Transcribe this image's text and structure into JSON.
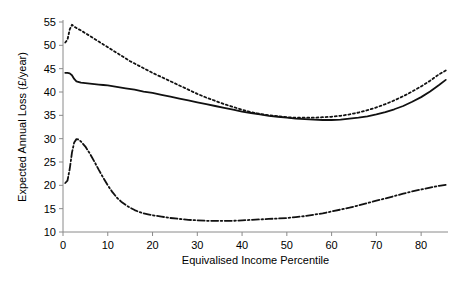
{
  "chart_data": {
    "type": "line",
    "title": "",
    "subtitle": "",
    "xlabel": "Equivalised Income Percentile",
    "ylabel": "Expected Annual Loss (£/year)",
    "xlim": [
      0,
      86
    ],
    "ylim": [
      10,
      55
    ],
    "xticks": [
      0,
      10,
      20,
      30,
      40,
      50,
      60,
      70,
      80
    ],
    "yticks": [
      10,
      15,
      20,
      25,
      30,
      35,
      40,
      45,
      50,
      55
    ],
    "xtick_labels": [
      "0",
      "10",
      "20",
      "30",
      "40",
      "50",
      "60",
      "70",
      "80"
    ],
    "ytick_labels": [
      "10",
      "15",
      "20",
      "25",
      "30",
      "35",
      "40",
      "45",
      "50",
      "55"
    ],
    "grid": false,
    "legend_position": "bottom",
    "line_color": "#111111",
    "axis_color": "#8a8a8a",
    "series": [
      {
        "name": "Black",
        "style": "dotted",
        "dasharray": "2,2.6",
        "width": 1.8,
        "x": [
          0.5,
          1,
          1.5,
          2,
          2.5,
          3,
          4,
          5,
          6,
          7,
          8,
          9,
          10,
          11,
          12,
          13,
          14,
          15,
          16,
          17,
          18,
          19,
          20,
          22,
          24,
          26,
          28,
          30,
          32,
          34,
          36,
          38,
          40,
          42,
          44,
          46,
          48,
          50,
          52,
          54,
          56,
          58,
          60,
          62,
          64,
          66,
          68,
          70,
          72,
          74,
          76,
          78,
          80,
          82,
          84,
          85.5
        ],
        "y": [
          50.6,
          51.2,
          53.4,
          54.4,
          54.0,
          53.7,
          53.2,
          52.6,
          52.0,
          51.4,
          50.8,
          50.2,
          49.6,
          49.0,
          48.4,
          47.8,
          47.2,
          46.6,
          46.1,
          45.6,
          45.1,
          44.6,
          44.1,
          43.2,
          42.3,
          41.4,
          40.5,
          39.6,
          38.8,
          38.1,
          37.4,
          36.8,
          36.2,
          35.7,
          35.3,
          35.0,
          34.8,
          34.6,
          34.5,
          34.5,
          34.5,
          34.6,
          34.7,
          34.9,
          35.2,
          35.6,
          36.1,
          36.7,
          37.4,
          38.2,
          39.1,
          40.1,
          41.2,
          42.4,
          43.8,
          44.6
        ]
      },
      {
        "name": "Asian",
        "style": "solid",
        "dasharray": "",
        "width": 1.8,
        "x": [
          0.5,
          1,
          1.5,
          2,
          2.5,
          3,
          4,
          5,
          6,
          7,
          8,
          9,
          10,
          12,
          14,
          16,
          18,
          20,
          22,
          24,
          26,
          28,
          30,
          32,
          34,
          36,
          38,
          40,
          42,
          44,
          46,
          48,
          50,
          52,
          54,
          56,
          58,
          60,
          62,
          64,
          66,
          68,
          70,
          72,
          74,
          76,
          78,
          80,
          82,
          84,
          85.5
        ],
        "y": [
          44.1,
          44.1,
          44.0,
          43.6,
          42.8,
          42.3,
          42.0,
          41.9,
          41.8,
          41.7,
          41.6,
          41.5,
          41.4,
          41.1,
          40.8,
          40.5,
          40.1,
          39.8,
          39.4,
          39.0,
          38.6,
          38.2,
          37.8,
          37.4,
          37.0,
          36.6,
          36.2,
          35.8,
          35.5,
          35.2,
          34.9,
          34.7,
          34.5,
          34.3,
          34.2,
          34.1,
          34.0,
          34.0,
          34.1,
          34.3,
          34.5,
          34.8,
          35.2,
          35.7,
          36.3,
          37.0,
          37.9,
          38.9,
          40.1,
          41.5,
          42.6
        ]
      },
      {
        "name": "White & other",
        "style": "dash-dot",
        "dasharray": "7,2.5,1.6,2.5",
        "width": 1.8,
        "x": [
          0.5,
          1,
          1.5,
          2,
          2.5,
          3,
          3.5,
          4,
          5,
          6,
          7,
          8,
          9,
          10,
          11,
          12,
          13,
          14,
          15,
          16,
          17,
          18,
          19,
          20,
          22,
          24,
          26,
          28,
          30,
          32,
          34,
          36,
          38,
          40,
          42,
          44,
          46,
          48,
          50,
          52,
          54,
          56,
          58,
          60,
          62,
          64,
          66,
          68,
          70,
          72,
          74,
          76,
          78,
          80,
          82,
          84,
          85.5
        ],
        "y": [
          20.5,
          21.0,
          23.5,
          27.0,
          29.2,
          29.9,
          29.8,
          29.4,
          28.3,
          26.8,
          25.1,
          23.3,
          21.6,
          20.0,
          18.6,
          17.4,
          16.5,
          15.8,
          15.2,
          14.7,
          14.3,
          14.0,
          13.8,
          13.6,
          13.3,
          13.0,
          12.8,
          12.6,
          12.5,
          12.4,
          12.4,
          12.4,
          12.4,
          12.5,
          12.6,
          12.7,
          12.8,
          12.9,
          13.0,
          13.2,
          13.4,
          13.7,
          14.0,
          14.4,
          14.8,
          15.2,
          15.7,
          16.2,
          16.7,
          17.2,
          17.7,
          18.2,
          18.7,
          19.1,
          19.5,
          19.9,
          20.1
        ]
      }
    ]
  },
  "legend": {
    "items": [
      {
        "label": "Black",
        "style": "dotted"
      },
      {
        "label": "Asian",
        "style": "solid"
      },
      {
        "label": "White & other",
        "style": "dash-dot"
      }
    ]
  }
}
